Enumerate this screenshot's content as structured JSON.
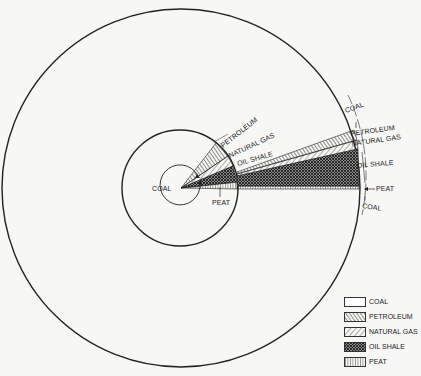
{
  "diagram": {
    "type": "concentric-pie-comparison",
    "outer_circle": {
      "cx": 181,
      "cy": 188,
      "r": 179
    },
    "inner_circle": {
      "cx": 180,
      "cy": 188,
      "r": 58
    },
    "inner_labels": {
      "petroleum": "PETROLEUM",
      "natural_gas": "NATURAL GAS",
      "oil_shale": "OIL SHALE",
      "coal": "COAL",
      "peat": "PEAT"
    },
    "outer_labels": {
      "coal_top": "COAL",
      "petroleum": "PETROLEUM",
      "natural_gas": "NATURAL GAS",
      "oil_shale": "OIL SHALE",
      "peat": "PEAT",
      "coal_bottom": "COAL"
    }
  },
  "legend": {
    "items": [
      {
        "label": "COAL",
        "pattern": "blank"
      },
      {
        "label": "PETROLEUM",
        "pattern": "diag-dense"
      },
      {
        "label": "NATURAL GAS",
        "pattern": "diag-sparse"
      },
      {
        "label": "OIL SHALE",
        "pattern": "crosshatch"
      },
      {
        "label": "PEAT",
        "pattern": "vertical"
      }
    ]
  },
  "colors": {
    "line": "#222222",
    "background": "#f7f7f5"
  }
}
